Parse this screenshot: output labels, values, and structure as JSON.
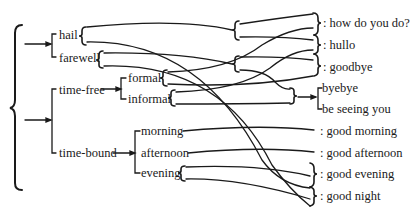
{
  "diagram": {
    "type": "system network",
    "left_labels": {
      "hail": "hail",
      "farewell": "farewell",
      "time_free": "time-free",
      "formal": "formal",
      "informal": "informal",
      "time_bound": "time-bound",
      "morning": "morning",
      "afternoon": "afternoon",
      "evening": "evening"
    },
    "right_labels": {
      "how_do_you_do": ": how do you do?",
      "hullo": ": hullo",
      "goodbye": ": goodbye",
      "byebye": "byebye",
      "be_seeing_you": "be seeing you",
      "good_morning": ": good morning",
      "good_afternoon": ": good afternoon",
      "good_evening": ": good evening",
      "good_night": ": good night"
    },
    "line_color": "#1a1a1a"
  }
}
